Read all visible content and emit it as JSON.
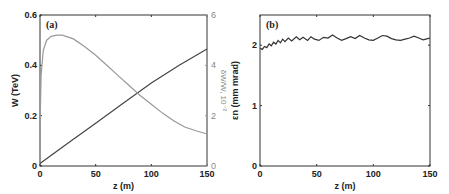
{
  "chart_data": [
    {
      "panel": "(a)",
      "type": "line",
      "xlabel": "z (m)",
      "ylabel": "W (TeV)",
      "ylabel_right": "δW/W, 10⁻²",
      "xlim": [
        0,
        150
      ],
      "ylim": [
        0,
        0.6
      ],
      "ylim_right": [
        0,
        6
      ],
      "xticks": [
        "0",
        "50",
        "100",
        "150"
      ],
      "yticks": [
        "0",
        "0.2",
        "0.4",
        "0.6"
      ],
      "yticks_right": [
        "0",
        "2",
        "4",
        "6"
      ],
      "series": [
        {
          "name": "W (TeV)",
          "axis": "left",
          "color": "#444444",
          "x": [
            0,
            25,
            50,
            75,
            100,
            125,
            150
          ],
          "y": [
            0.01,
            0.09,
            0.17,
            0.25,
            0.33,
            0.4,
            0.465
          ]
        },
        {
          "name": "δW/W (10⁻²)",
          "axis": "right",
          "color": "#999999",
          "x": [
            0,
            1,
            3,
            6,
            10,
            15,
            20,
            30,
            40,
            50,
            60,
            70,
            80,
            90,
            100,
            110,
            120,
            130,
            140,
            150
          ],
          "y": [
            1.5,
            3.6,
            4.6,
            5.0,
            5.15,
            5.2,
            5.2,
            5.05,
            4.75,
            4.4,
            4.0,
            3.6,
            3.2,
            2.8,
            2.45,
            2.1,
            1.8,
            1.55,
            1.4,
            1.27
          ]
        }
      ]
    },
    {
      "panel": "(b)",
      "type": "line",
      "xlabel": "z (m)",
      "ylabel": "εn (mm mrad)",
      "xlim": [
        0,
        150
      ],
      "ylim": [
        0,
        2.5
      ],
      "xticks": [
        "0",
        "50",
        "100",
        "150"
      ],
      "yticks": [
        "0",
        "1",
        "2"
      ],
      "series": [
        {
          "name": "εn",
          "color": "#333333",
          "x": [
            0,
            2,
            4,
            6,
            8,
            10,
            12,
            14,
            16,
            18,
            20,
            22,
            25,
            28,
            32,
            35,
            38,
            42,
            45,
            48,
            52,
            56,
            60,
            64,
            68,
            72,
            76,
            80,
            84,
            88,
            92,
            96,
            100,
            104,
            108,
            112,
            116,
            120,
            124,
            128,
            132,
            136,
            140,
            144,
            148,
            150
          ],
          "y": [
            1.95,
            1.93,
            1.98,
            1.96,
            2.02,
            1.99,
            2.05,
            2.02,
            2.08,
            2.04,
            2.1,
            2.06,
            2.12,
            2.07,
            2.14,
            2.09,
            2.13,
            2.08,
            2.14,
            2.1,
            2.08,
            2.13,
            2.12,
            2.17,
            2.12,
            2.08,
            2.11,
            2.14,
            2.11,
            2.16,
            2.12,
            2.09,
            2.08,
            2.12,
            2.16,
            2.15,
            2.11,
            2.09,
            2.08,
            2.1,
            2.12,
            2.15,
            2.12,
            2.09,
            2.11,
            2.12
          ]
        }
      ]
    }
  ],
  "labels": {
    "panel_a": "(a)",
    "panel_b": "(b)",
    "xlabel_a": "z (m)",
    "xlabel_b": "z (m)",
    "ylabel_a": "W (TeV)",
    "ylabel_a_right": "δW/W, 10⁻²",
    "ylabel_b": "εn (mm mrad)"
  }
}
